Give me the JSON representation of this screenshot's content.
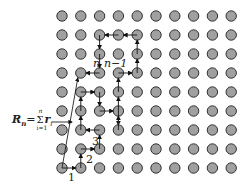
{
  "diagram": {
    "type": "lattice-random-walk",
    "grid": {
      "cols": 10,
      "rows": 9,
      "x0": 62,
      "y0": 16,
      "dx": 18.8,
      "dy": 19.0,
      "dot_fill": "#a0a0a0",
      "dot_stroke": "#333333"
    },
    "labels": {
      "step1": "1",
      "step2": "2",
      "step3": "3",
      "step_n": "n",
      "step_n_minus_1": "n−1",
      "resultant_symbol": "R",
      "resultant_sub": "n",
      "equals": "=",
      "sum_sign": "Σ",
      "sum_upper": "n",
      "sum_lower": "i=1",
      "summand": "r",
      "summand_sub": "i"
    },
    "path": [
      [
        0,
        8
      ],
      [
        1,
        8
      ],
      [
        1,
        7
      ],
      [
        2,
        7
      ],
      [
        2,
        6
      ],
      [
        1,
        6
      ],
      [
        1,
        5
      ],
      [
        1,
        4
      ],
      [
        2,
        4
      ],
      [
        2,
        5
      ],
      [
        3,
        5
      ],
      [
        3,
        6
      ],
      [
        3,
        3
      ],
      [
        4,
        3
      ],
      [
        4,
        1
      ],
      [
        3,
        1
      ],
      [
        2,
        1
      ],
      [
        2,
        3
      ],
      [
        1,
        3
      ]
    ],
    "resultant": {
      "from": [
        0,
        8
      ],
      "to": [
        1,
        3
      ]
    }
  }
}
